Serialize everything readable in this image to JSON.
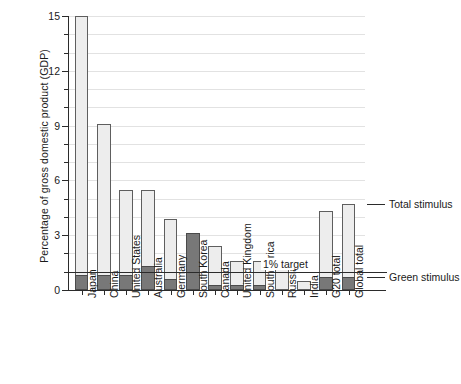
{
  "chart_data": {
    "type": "bar",
    "title": "",
    "xlabel": "",
    "ylabel": "Percentage of gross domestic product (GDP)",
    "ylim": [
      0,
      15
    ],
    "ytick_labels": [
      "0",
      "3",
      "6",
      "9",
      "12",
      "15"
    ],
    "ytick_values": [
      0,
      3,
      6,
      9,
      12,
      15
    ],
    "minor_tick_interval": 1,
    "grid": "horizontal",
    "stacked": true,
    "legend_position": "right",
    "categories": [
      "Japan",
      "China",
      "United States",
      "Australia",
      "Germany",
      "South Korea",
      "Canada",
      "United Kingdom",
      "South Africa",
      "Russia",
      "India",
      "G20 total",
      "Global total"
    ],
    "series": [
      {
        "name": "Green stimulus",
        "color": "#787878",
        "values": [
          0.8,
          0.8,
          0.8,
          1.3,
          0.6,
          3.1,
          0.25,
          0.25,
          0.25,
          0.0,
          0.0,
          0.7,
          0.7
        ]
      },
      {
        "name": "Total stimulus",
        "color": "#ededed",
        "values": [
          15.0,
          9.1,
          5.5,
          5.5,
          3.9,
          3.1,
          2.4,
          1.6,
          1.6,
          1.2,
          0.5,
          4.3,
          4.7
        ]
      }
    ],
    "annotations": [
      {
        "text": "1% target",
        "value": 1.0,
        "type": "hline"
      }
    ],
    "legend": [
      {
        "label": "Total stimulus",
        "value": 4.7
      },
      {
        "label": "Green stimulus",
        "value": 0.7
      }
    ]
  }
}
